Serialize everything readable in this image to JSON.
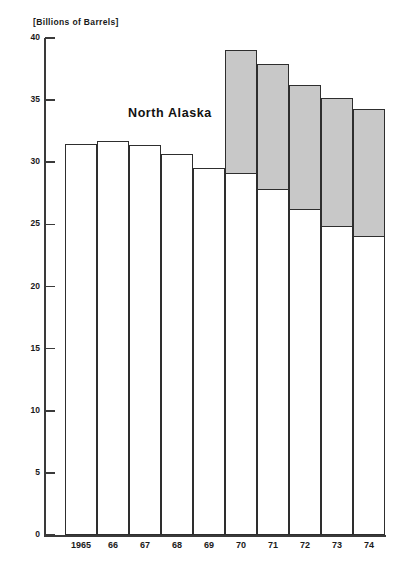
{
  "chart_data": {
    "type": "bar",
    "title": "",
    "subtitle": "",
    "unit_caption": "[Billions of Barrels]",
    "xlabel": "",
    "ylabel": "",
    "ylim": [
      0,
      40
    ],
    "ytick_values": [
      0,
      5,
      10,
      15,
      20,
      25,
      30,
      35,
      40
    ],
    "ytick_labels": [
      "0",
      "5",
      "10",
      "15",
      "20",
      "25",
      "30",
      "35",
      "40"
    ],
    "grid": false,
    "legend_position": "in-plot-annotation",
    "stacked": true,
    "categories": [
      "1965",
      "66",
      "67",
      "68",
      "69",
      "70",
      "71",
      "72",
      "73",
      "74"
    ],
    "series": [
      {
        "name": "Lower 48 / Other",
        "values": [
          31.5,
          31.7,
          31.4,
          30.7,
          29.5,
          29.2,
          27.9,
          26.3,
          24.9,
          24.1
        ]
      },
      {
        "name": "North Alaska",
        "values": [
          0,
          0,
          0,
          0,
          0,
          9.8,
          10.0,
          9.9,
          10.3,
          10.2
        ]
      }
    ],
    "totals": [
      31.5,
      31.7,
      31.4,
      30.7,
      29.5,
      39.0,
      37.9,
      36.2,
      35.2,
      34.3
    ],
    "annotations": [
      {
        "text": "North Alaska",
        "x": 128,
        "y": 106
      }
    ],
    "colors": {
      "north_alaska_fill": "#c8c8c8",
      "base_fill": "#ffffff",
      "bar_outline": "#2e2e2e",
      "axis": "#3a3a3a",
      "text": "#1a1a1a",
      "background": "#ffffff"
    }
  },
  "axis": {
    "unit_caption": "[Billions of Barrels]",
    "y_ticks": [
      {
        "label": "40",
        "value": 40
      },
      {
        "label": "35",
        "value": 35
      },
      {
        "label": "30",
        "value": 30
      },
      {
        "label": "25",
        "value": 25
      },
      {
        "label": "20",
        "value": 20
      },
      {
        "label": "15",
        "value": 15
      },
      {
        "label": "10",
        "value": 10
      },
      {
        "label": "5",
        "value": 5
      },
      {
        "label": "0",
        "value": 0
      }
    ],
    "x_ticks": [
      {
        "label": "1965"
      },
      {
        "label": "66"
      },
      {
        "label": "67"
      },
      {
        "label": "68"
      },
      {
        "label": "69"
      },
      {
        "label": "70"
      },
      {
        "label": "71"
      },
      {
        "label": "72"
      },
      {
        "label": "73"
      },
      {
        "label": "74"
      }
    ]
  },
  "annotation": {
    "north_alaska_label": "North Alaska"
  }
}
